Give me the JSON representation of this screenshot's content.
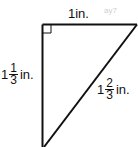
{
  "diagram": {
    "type": "right-triangle",
    "right_angle_marker": true,
    "colors": {
      "line": "#111111",
      "background": "#ffffff",
      "watermark": "#cfcfcf"
    },
    "labels": {
      "top": {
        "text": "1in."
      },
      "left": {
        "whole": "1",
        "numerator": "1",
        "denominator": "3",
        "unit": "in."
      },
      "hypotenuse": {
        "whole": "1",
        "numerator": "2",
        "denominator": "3",
        "unit": "in."
      }
    },
    "watermark": "ay7"
  }
}
